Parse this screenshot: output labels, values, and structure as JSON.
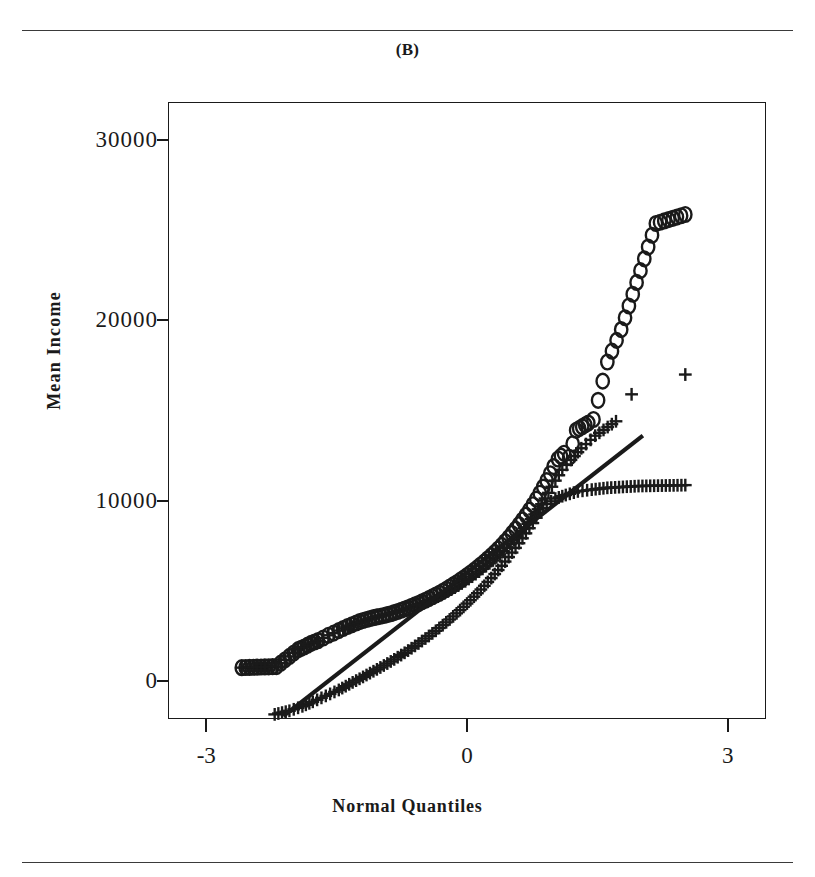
{
  "figure": {
    "panel_title": "(B)",
    "top_rule": true,
    "bottom_rule": true
  },
  "axes": {
    "x_title": "Normal Quantiles",
    "y_title": "Mean Income",
    "x_ticks": [
      "-3",
      "0",
      "3"
    ],
    "y_ticks": [
      "0",
      "10000",
      "20000",
      "30000"
    ]
  },
  "chart_data": {
    "type": "scatter",
    "title": "(B)",
    "xlabel": "Normal Quantiles",
    "ylabel": "Mean Income",
    "xlim": [
      -3.44,
      3.44
    ],
    "ylim": [
      -2100,
      32100
    ],
    "xticks": [
      -3,
      0,
      3
    ],
    "yticks": [
      0,
      10000,
      20000,
      30000
    ],
    "grid": false,
    "legend": "none",
    "frame": "box",
    "series": [
      {
        "name": "circle-series",
        "marker": "o",
        "points": [
          [
            -2.6,
            700
          ],
          [
            -2.2,
            760
          ],
          [
            -1.95,
            1700
          ],
          [
            -1.88,
            1850
          ],
          [
            -1.8,
            2050
          ],
          [
            -1.72,
            2200
          ],
          [
            -1.66,
            2350
          ],
          [
            -1.6,
            2500
          ],
          [
            -1.54,
            2620
          ],
          [
            -1.48,
            2760
          ],
          [
            -1.43,
            2880
          ],
          [
            -1.38,
            2990
          ],
          [
            -1.33,
            3080
          ],
          [
            -1.28,
            3180
          ],
          [
            -1.24,
            3260
          ],
          [
            -1.2,
            3320
          ],
          [
            -1.16,
            3380
          ],
          [
            -1.12,
            3430
          ],
          [
            -1.08,
            3480
          ],
          [
            -1.04,
            3520
          ],
          [
            -1.0,
            3560
          ],
          [
            -0.96,
            3600
          ],
          [
            -0.92,
            3650
          ],
          [
            -0.88,
            3700
          ],
          [
            -0.84,
            3760
          ],
          [
            -0.8,
            3820
          ],
          [
            -0.76,
            3890
          ],
          [
            -0.72,
            3960
          ],
          [
            -0.68,
            4030
          ],
          [
            -0.64,
            4110
          ],
          [
            -0.6,
            4190
          ],
          [
            -0.56,
            4270
          ],
          [
            -0.52,
            4360
          ],
          [
            -0.48,
            4450
          ],
          [
            -0.44,
            4540
          ],
          [
            -0.4,
            4640
          ],
          [
            -0.36,
            4740
          ],
          [
            -0.32,
            4840
          ],
          [
            -0.28,
            4950
          ],
          [
            -0.24,
            5060
          ],
          [
            -0.2,
            5180
          ],
          [
            -0.16,
            5300
          ],
          [
            -0.12,
            5420
          ],
          [
            -0.08,
            5550
          ],
          [
            -0.04,
            5680
          ],
          [
            0.0,
            5820
          ],
          [
            0.04,
            5960
          ],
          [
            0.08,
            6110
          ],
          [
            0.12,
            6260
          ],
          [
            0.16,
            6420
          ],
          [
            0.2,
            6580
          ],
          [
            0.24,
            6750
          ],
          [
            0.28,
            6930
          ],
          [
            0.32,
            7110
          ],
          [
            0.36,
            7300
          ],
          [
            0.4,
            7500
          ],
          [
            0.44,
            7710
          ],
          [
            0.48,
            7930
          ],
          [
            0.52,
            8160
          ],
          [
            0.56,
            8400
          ],
          [
            0.6,
            8650
          ],
          [
            0.64,
            8910
          ],
          [
            0.68,
            9180
          ],
          [
            0.72,
            9460
          ],
          [
            0.76,
            9760
          ],
          [
            0.8,
            10070
          ],
          [
            0.84,
            10400
          ],
          [
            0.88,
            10740
          ],
          [
            0.92,
            11100
          ],
          [
            0.96,
            11480
          ],
          [
            1.0,
            11880
          ],
          [
            1.05,
            12300
          ],
          [
            1.12,
            12620
          ],
          [
            1.18,
            12400
          ],
          [
            1.26,
            13900
          ],
          [
            1.33,
            14100
          ],
          [
            1.4,
            14300
          ],
          [
            1.46,
            14500
          ],
          [
            1.62,
            17700
          ],
          [
            1.78,
            19500
          ],
          [
            2.18,
            25400
          ],
          [
            2.52,
            25900
          ]
        ]
      },
      {
        "name": "plus-series-upper",
        "marker": "+",
        "points": [
          [
            -2.6,
            700
          ],
          [
            -2.2,
            760
          ],
          [
            -1.95,
            1700
          ],
          [
            -1.88,
            1850
          ],
          [
            -1.8,
            2050
          ],
          [
            -1.72,
            2200
          ],
          [
            -1.66,
            2350
          ],
          [
            -1.6,
            2500
          ],
          [
            -1.54,
            2620
          ],
          [
            -1.48,
            2760
          ],
          [
            -1.43,
            2880
          ],
          [
            -1.38,
            2990
          ],
          [
            -1.3,
            3100
          ],
          [
            -1.22,
            3240
          ],
          [
            -1.14,
            3380
          ],
          [
            -1.06,
            3500
          ],
          [
            -0.98,
            3600
          ],
          [
            -0.9,
            3700
          ],
          [
            -0.82,
            3800
          ],
          [
            -0.74,
            3920
          ],
          [
            -0.66,
            4040
          ],
          [
            -0.58,
            4180
          ],
          [
            -0.5,
            4320
          ],
          [
            -0.42,
            4480
          ],
          [
            -0.34,
            4650
          ],
          [
            -0.26,
            4840
          ],
          [
            -0.18,
            5040
          ],
          [
            -0.1,
            5260
          ],
          [
            -0.02,
            5500
          ],
          [
            0.06,
            5760
          ],
          [
            0.14,
            6040
          ],
          [
            0.22,
            6340
          ],
          [
            0.3,
            6660
          ],
          [
            0.38,
            7000
          ],
          [
            0.46,
            7380
          ],
          [
            0.54,
            7780
          ],
          [
            0.62,
            8220
          ],
          [
            0.7,
            8700
          ],
          [
            0.78,
            9220
          ],
          [
            0.86,
            9790
          ],
          [
            0.94,
            10420
          ],
          [
            1.02,
            11100
          ],
          [
            1.1,
            11700
          ],
          [
            1.2,
            12250
          ],
          [
            1.32,
            12900
          ],
          [
            1.48,
            13600
          ],
          [
            1.72,
            14400
          ]
        ]
      },
      {
        "name": "plus-series-lower",
        "marker": "+",
        "points": [
          [
            -2.22,
            -1900
          ],
          [
            -2.05,
            -1700
          ],
          [
            -1.9,
            -1450
          ],
          [
            -1.78,
            -1200
          ],
          [
            -1.68,
            -980
          ],
          [
            -1.58,
            -760
          ],
          [
            -1.48,
            -540
          ],
          [
            -1.4,
            -330
          ],
          [
            -1.32,
            -120
          ],
          [
            -1.24,
            80
          ],
          [
            -1.16,
            290
          ],
          [
            -1.08,
            500
          ],
          [
            -1.0,
            710
          ],
          [
            -0.92,
            930
          ],
          [
            -0.84,
            1160
          ],
          [
            -0.76,
            1400
          ],
          [
            -0.68,
            1650
          ],
          [
            -0.6,
            1910
          ],
          [
            -0.52,
            2180
          ],
          [
            -0.44,
            2460
          ],
          [
            -0.36,
            2750
          ],
          [
            -0.28,
            3060
          ],
          [
            -0.2,
            3380
          ],
          [
            -0.12,
            3720
          ],
          [
            -0.04,
            4080
          ],
          [
            0.04,
            4450
          ],
          [
            0.12,
            4840
          ],
          [
            0.2,
            5250
          ],
          [
            0.28,
            5680
          ],
          [
            0.36,
            6130
          ],
          [
            0.44,
            6600
          ],
          [
            0.52,
            7100
          ],
          [
            0.6,
            7620
          ],
          [
            0.68,
            8170
          ],
          [
            0.76,
            8740
          ],
          [
            0.84,
            9330
          ],
          [
            0.92,
            9800
          ],
          [
            1.02,
            10100
          ],
          [
            1.14,
            10300
          ],
          [
            1.28,
            10500
          ],
          [
            1.44,
            10600
          ],
          [
            1.62,
            10700
          ],
          [
            1.98,
            10800
          ],
          [
            2.52,
            10850
          ]
        ]
      },
      {
        "name": "plus-series-upper-outliers",
        "marker": "+",
        "points": [
          [
            1.9,
            15900
          ],
          [
            2.52,
            17000
          ]
        ]
      }
    ],
    "reference_line": {
      "name": "fit-line",
      "x_start": -2.12,
      "y_start": -2000,
      "x_end": 2.03,
      "y_end": 13600
    }
  }
}
